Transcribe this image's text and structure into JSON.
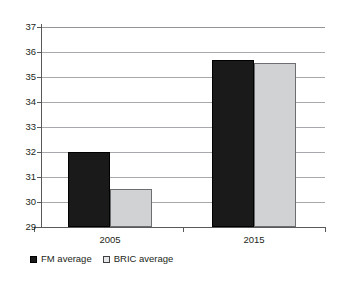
{
  "chart_data": {
    "type": "bar",
    "title": "",
    "subtitle": "",
    "xlabel": "",
    "ylabel": "",
    "categories": [
      "2005",
      "2015"
    ],
    "series": [
      {
        "name": "FM average",
        "values": [
          32.0,
          35.68
        ],
        "color": "#1a1a1a"
      },
      {
        "name": "BRIC average",
        "values": [
          30.53,
          35.55
        ],
        "color": "#d0d2d3"
      }
    ],
    "ylim": [
      29,
      37
    ],
    "yticks": [
      29,
      30,
      31,
      32,
      33,
      34,
      35,
      36,
      37
    ],
    "ytick_labels": [
      "29",
      "30",
      "31",
      "32",
      "33",
      "34",
      "35",
      "36",
      "37"
    ],
    "grid": true,
    "grid_axis": "y",
    "legend_position": "bottom-left",
    "bar_gap": 0
  },
  "legend": {
    "entries": [
      {
        "label": "FM average",
        "marker": "filled-square-marker"
      },
      {
        "label": "BRIC average",
        "marker": "outlined-square-marker"
      }
    ]
  },
  "colors": {
    "series_fm": "#1a1a1a",
    "series_bric": "#d0d2d3",
    "gridline": "#a7a9ac",
    "axis": "#58595b",
    "text": "#231f20",
    "background": "#ffffff"
  }
}
